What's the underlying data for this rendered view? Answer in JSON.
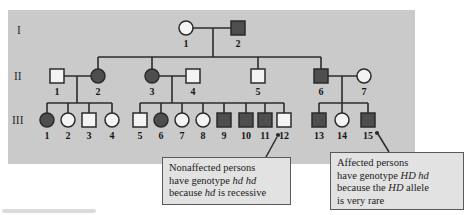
{
  "figure": {
    "colors": {
      "panel": "#cacaca",
      "line": "#2b2b2b",
      "symbol_stroke": "#2b2b2b",
      "affected_fill": "#4e4e4e",
      "unaffected_fill": "#f3f3f3",
      "label_text": "#161616",
      "callout_bg": "#e2e2e2",
      "callout_border": "#5a5a5a"
    },
    "panel": {
      "x": 8,
      "y": 10,
      "w": 407,
      "h": 154
    },
    "generation_labels": [
      {
        "text": "I",
        "x": 17,
        "y": 31
      },
      {
        "text": "II",
        "x": 14,
        "y": 77
      },
      {
        "text": "III",
        "x": 12,
        "y": 121
      }
    ],
    "individuals": [
      {
        "id": "I-1",
        "label": "1",
        "sex": "female",
        "affected": false,
        "x": 186,
        "y": 28
      },
      {
        "id": "I-2",
        "label": "2",
        "sex": "male",
        "affected": true,
        "x": 238,
        "y": 28
      },
      {
        "id": "II-1",
        "label": "1",
        "sex": "male",
        "affected": false,
        "x": 57,
        "y": 76
      },
      {
        "id": "II-2",
        "label": "2",
        "sex": "female",
        "affected": true,
        "x": 98,
        "y": 76
      },
      {
        "id": "II-3",
        "label": "3",
        "sex": "female",
        "affected": true,
        "x": 152,
        "y": 76
      },
      {
        "id": "II-4",
        "label": "4",
        "sex": "male",
        "affected": false,
        "x": 193,
        "y": 76
      },
      {
        "id": "II-5",
        "label": "5",
        "sex": "male",
        "affected": false,
        "x": 258,
        "y": 76
      },
      {
        "id": "II-6",
        "label": "6",
        "sex": "male",
        "affected": true,
        "x": 321,
        "y": 76
      },
      {
        "id": "II-7",
        "label": "7",
        "sex": "female",
        "affected": false,
        "x": 364,
        "y": 76
      },
      {
        "id": "III-1",
        "label": "1",
        "sex": "female",
        "affected": true,
        "x": 47,
        "y": 120
      },
      {
        "id": "III-2",
        "label": "2",
        "sex": "female",
        "affected": false,
        "x": 68,
        "y": 120
      },
      {
        "id": "III-3",
        "label": "3",
        "sex": "male",
        "affected": false,
        "x": 89,
        "y": 120
      },
      {
        "id": "III-4",
        "label": "4",
        "sex": "female",
        "affected": false,
        "x": 112,
        "y": 120
      },
      {
        "id": "III-5",
        "label": "5",
        "sex": "male",
        "affected": false,
        "x": 140,
        "y": 120
      },
      {
        "id": "III-6",
        "label": "6",
        "sex": "female",
        "affected": true,
        "x": 161,
        "y": 120
      },
      {
        "id": "III-7",
        "label": "7",
        "sex": "female",
        "affected": false,
        "x": 182,
        "y": 120
      },
      {
        "id": "III-8",
        "label": "8",
        "sex": "female",
        "affected": false,
        "x": 203,
        "y": 120
      },
      {
        "id": "III-9",
        "label": "9",
        "sex": "male",
        "affected": true,
        "x": 224,
        "y": 120
      },
      {
        "id": "III-10",
        "label": "10",
        "sex": "male",
        "affected": true,
        "x": 246,
        "y": 120
      },
      {
        "id": "III-11",
        "label": "11",
        "sex": "male",
        "affected": true,
        "x": 265,
        "y": 120
      },
      {
        "id": "III-12",
        "label": "12",
        "sex": "male",
        "affected": false,
        "x": 284,
        "y": 120
      },
      {
        "id": "III-13",
        "label": "13",
        "sex": "male",
        "affected": true,
        "x": 319,
        "y": 120
      },
      {
        "id": "III-14",
        "label": "14",
        "sex": "female",
        "affected": false,
        "x": 342,
        "y": 120
      },
      {
        "id": "III-15",
        "label": "15",
        "sex": "male",
        "affected": true,
        "x": 368,
        "y": 120
      }
    ],
    "connectors": [
      [
        186,
        28,
        238,
        28
      ],
      [
        213,
        28,
        213,
        57
      ],
      [
        98,
        57,
        321,
        57
      ],
      [
        98,
        57,
        98,
        76
      ],
      [
        152,
        57,
        152,
        76
      ],
      [
        258,
        57,
        258,
        76
      ],
      [
        321,
        57,
        321,
        76
      ],
      [
        57,
        76,
        98,
        76
      ],
      [
        77,
        76,
        77,
        103
      ],
      [
        47,
        103,
        112,
        103
      ],
      [
        47,
        103,
        47,
        120
      ],
      [
        68,
        103,
        68,
        120
      ],
      [
        89,
        103,
        89,
        120
      ],
      [
        112,
        103,
        112,
        120
      ],
      [
        152,
        76,
        193,
        76
      ],
      [
        172,
        76,
        172,
        103
      ],
      [
        140,
        103,
        284,
        103
      ],
      [
        140,
        103,
        140,
        120
      ],
      [
        161,
        103,
        161,
        120
      ],
      [
        182,
        103,
        182,
        120
      ],
      [
        203,
        103,
        203,
        120
      ],
      [
        224,
        103,
        224,
        120
      ],
      [
        246,
        103,
        246,
        120
      ],
      [
        265,
        103,
        265,
        120
      ],
      [
        284,
        103,
        284,
        120
      ],
      [
        321,
        76,
        364,
        76
      ],
      [
        342,
        76,
        342,
        103
      ],
      [
        319,
        103,
        368,
        103
      ],
      [
        319,
        103,
        319,
        120
      ],
      [
        342,
        103,
        342,
        120
      ],
      [
        368,
        103,
        368,
        120
      ]
    ],
    "pointers": [
      {
        "dot": [
          278,
          135
        ],
        "line": [
          277,
          137,
          266,
          157
        ]
      },
      {
        "dot": [
          377,
          133
        ],
        "line": [
          378,
          134,
          389,
          152
        ]
      }
    ],
    "callouts": [
      {
        "name": "nonaffected",
        "box": {
          "left": 162,
          "top": 157,
          "width": 129,
          "height": 48
        },
        "lines": [
          [
            {
              "t": "Nonaffected persons"
            }
          ],
          [
            {
              "t": "have genotype "
            },
            {
              "t": "hd hd",
              "i": true
            }
          ],
          [
            {
              "t": "because "
            },
            {
              "t": "hd",
              "i": true
            },
            {
              "t": " is recessive"
            }
          ]
        ]
      },
      {
        "name": "affected",
        "box": {
          "left": 330,
          "top": 152,
          "width": 134,
          "height": 58
        },
        "lines": [
          [
            {
              "t": "Affected persons"
            }
          ],
          [
            {
              "t": "have genotype "
            },
            {
              "t": "HD hd",
              "i": true
            }
          ],
          [
            {
              "t": "because the "
            },
            {
              "t": "HD",
              "i": true
            },
            {
              "t": " allele"
            }
          ],
          [
            {
              "t": "is very rare"
            }
          ]
        ]
      }
    ]
  }
}
